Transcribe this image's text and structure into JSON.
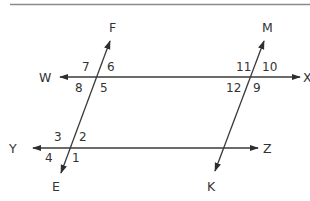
{
  "diagram": {
    "colors": {
      "line": "#3a3a3a",
      "text": "#333333",
      "rule": "#8a8a8a"
    },
    "points": {
      "F": "F",
      "E": "E",
      "M": "M",
      "K": "K",
      "W": "W",
      "X": "X",
      "Y": "Y",
      "Z": "Z"
    },
    "lines": [
      {
        "name": "WX",
        "type": "line",
        "from": "W",
        "to": "X"
      },
      {
        "name": "YZ",
        "type": "line",
        "from": "Y",
        "to": "Z"
      },
      {
        "name": "FE",
        "type": "transversal",
        "from": "F",
        "to": "E"
      },
      {
        "name": "MK",
        "type": "transversal",
        "from": "M",
        "to": "K"
      }
    ],
    "angles": {
      "a1": "1",
      "a2": "2",
      "a3": "3",
      "a4": "4",
      "a5": "5",
      "a6": "6",
      "a7": "7",
      "a8": "8",
      "a9": "9",
      "a10": "10",
      "a11": "11",
      "a12": "12"
    }
  }
}
